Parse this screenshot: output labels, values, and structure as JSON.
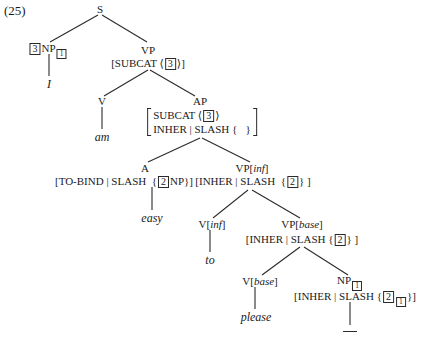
{
  "example_number": "(25)",
  "tree": {
    "S": {
      "label": "S"
    },
    "NP_subj": {
      "tag": "3",
      "label": "NP",
      "index": "1",
      "word": "I"
    },
    "VP_top": {
      "label": "VP",
      "feat_open": "[SUBCAT ⟨",
      "feat_tag": "3",
      "feat_close": "⟩]"
    },
    "V_am": {
      "label": "V",
      "word": "am"
    },
    "AP": {
      "label": "AP",
      "row1_attr": "SUBCAT ⟨",
      "row1_tag": "3",
      "row1_close": "⟩",
      "row2": "INHER | SLASH {   }"
    },
    "A": {
      "label": "A",
      "feat_open": "[TO-BIND | SLASH  {",
      "feat_tag": "2",
      "feat_close": "NP}]",
      "word": "easy"
    },
    "VP_inf": {
      "label": "VP[",
      "label_feat": "inf",
      "label_close": "]",
      "feat_open": "[INHER | SLASH  {",
      "feat_tag": "2",
      "feat_close": "} ]"
    },
    "V_inf": {
      "label": "V[",
      "label_feat": "inf",
      "label_close": "]",
      "word": "to"
    },
    "VP_base": {
      "label": "VP[",
      "label_feat": "base",
      "label_close": "]",
      "feat_open": "[INHER | SLASH {",
      "feat_tag": "2",
      "feat_close": "} ]"
    },
    "V_base": {
      "label": "V[",
      "label_feat": "base",
      "label_close": "]",
      "word": "please"
    },
    "NP_trace": {
      "label": "NP",
      "index": "1",
      "feat_open": "[INHER | SLASH {",
      "feat_tag": "2",
      "feat_index": "1",
      "feat_close": "}]",
      "word": "___"
    }
  }
}
